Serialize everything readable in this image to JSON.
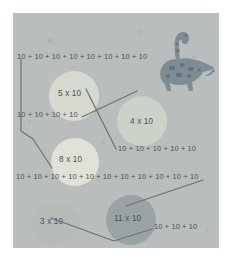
{
  "worksheet": {
    "title": "Multiplication as repeated addition matching activity",
    "background_color": "#b9bdbb",
    "page_color": "#ffffff",
    "text_color": "#4d5357",
    "line_color": "#6c7276",
    "illustration": {
      "name": "brachiosaurus-dinosaur",
      "body_color": "#7d8c95",
      "spot_color": "#5f7079"
    },
    "bubbles": [
      {
        "id": "b5",
        "label": "5 x 10",
        "color": "#d6d9ce"
      },
      {
        "id": "b4",
        "label": "4 x 10",
        "color": "#cdd2c8"
      },
      {
        "id": "b8",
        "label": "8 x 10",
        "color": "#e0e2d8"
      },
      {
        "id": "b3",
        "label": "3 x 10",
        "color": "#b4b9b6"
      },
      {
        "id": "b11",
        "label": "11 x 10",
        "color": "#9aa2a4"
      }
    ],
    "sums": [
      {
        "id": "s8",
        "text": "10 + 10 + 10 + 10 + 10 + 10 + 10 + 10",
        "count": 8
      },
      {
        "id": "s4",
        "text": "10 + 10 + 10 + 10",
        "count": 4
      },
      {
        "id": "s5",
        "text": "10 + 10 + 10 + 10 + 10",
        "count": 5
      },
      {
        "id": "s11",
        "text": "10 + 10 + 10 + 10 + 10 + 10 + 10 + 10 + 10 + 10 + 10",
        "count": 11
      },
      {
        "id": "s3",
        "text": "10 + 10 + 10",
        "count": 3
      }
    ],
    "connections": [
      {
        "from": "s8",
        "to": "b8"
      },
      {
        "from": "s4",
        "to": "b4"
      },
      {
        "from": "s5",
        "to": "b5"
      },
      {
        "from": "s11",
        "to": "b11"
      },
      {
        "from": "s3",
        "to": "b3"
      }
    ]
  }
}
